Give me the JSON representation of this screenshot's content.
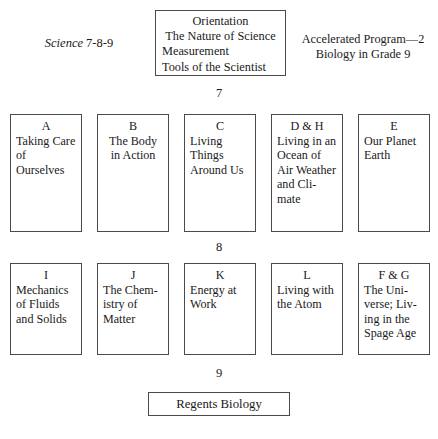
{
  "header": {
    "science_label_italic": "Science",
    "science_label_rest": " 7-8-9",
    "orientation_box": {
      "line1": "Orientation",
      "line2": "The Nature of Science",
      "line3": "Measurement",
      "line4": "Tools of the Scientist"
    },
    "accelerated": {
      "line1": "Accelerated Program—2",
      "line2": "Biology in Grade 9"
    }
  },
  "grade_markers": {
    "grade_7": "7",
    "grade_8": "8",
    "grade_9": "9"
  },
  "rows": [
    {
      "grade": "7",
      "units": [
        {
          "code": "A",
          "title": "Taking Care of Ourselves",
          "align": "left"
        },
        {
          "code": "B",
          "title": "The Body in Action",
          "align": "center"
        },
        {
          "code": "C",
          "title": "Living Things Around Us",
          "align": "left"
        },
        {
          "code": "D & H",
          "title": "Living in an Ocean of Air Weather and Cli-mate",
          "align": "left"
        },
        {
          "code": "E",
          "title": "Our Planet Earth",
          "align": "left"
        }
      ]
    },
    {
      "grade": "8",
      "units": [
        {
          "code": "I",
          "title": "Mechanics of Fluids and Solids",
          "align": "left"
        },
        {
          "code": "J",
          "title": "The Chem-istry of Matter",
          "align": "left"
        },
        {
          "code": "K",
          "title": "Energy at Work",
          "align": "left"
        },
        {
          "code": "L",
          "title": "Living with the Atom",
          "align": "left"
        },
        {
          "code": "F & G",
          "title": "The Uni-verse; Liv-ing in the Spage Age",
          "align": "left"
        }
      ]
    }
  ],
  "footer": {
    "regents_label": "Regents Biology"
  }
}
